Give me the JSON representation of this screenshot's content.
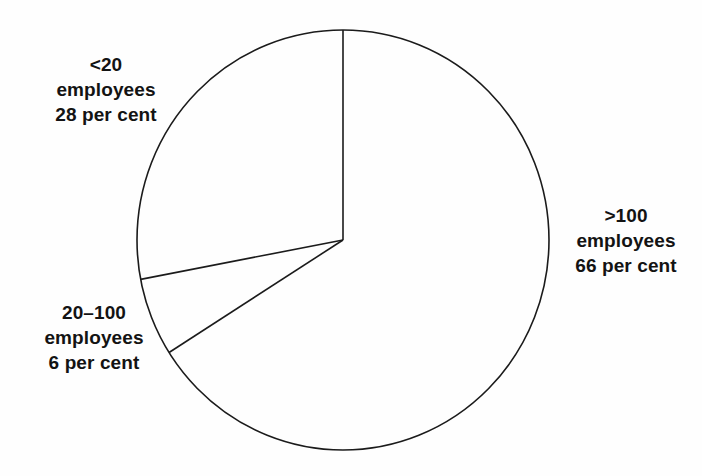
{
  "chart_data": {
    "type": "pie",
    "title": "",
    "xlabel": "",
    "ylabel": "",
    "categories": [
      "<20 employees",
      "20–100 employees",
      ">100 employees"
    ],
    "values": [
      28,
      6,
      66
    ],
    "value_unit": "per cent",
    "legend_position": "outside-labels",
    "grid": false,
    "start_angle_deg": 0,
    "direction": "counterclockwise",
    "slices": [
      {
        "name": "<20 employees",
        "category_line": "<20",
        "unit_line": "employees",
        "value": 28,
        "value_line": "28 per cent",
        "start_deg": 0,
        "end_deg": 100.8,
        "fill": "#ffffff",
        "stroke": "#1b1b1b"
      },
      {
        "name": "20–100 employees",
        "category_line": "20–100",
        "unit_line": "employees",
        "value": 6,
        "value_line": "6 per cent",
        "start_deg": 100.8,
        "end_deg": 122.4,
        "fill": "#ffffff",
        "stroke": "#1b1b1b"
      },
      {
        "name": ">100 employees",
        "category_line": ">100",
        "unit_line": "employees",
        "value": 66,
        "value_line": "66 per cent",
        "start_deg": 122.4,
        "end_deg": 360,
        "fill": "#ffffff",
        "stroke": "#1b1b1b"
      }
    ]
  },
  "figure": {
    "background": "#fefefe",
    "outline_color": "#1b1b1b",
    "text_color": "#131313"
  }
}
